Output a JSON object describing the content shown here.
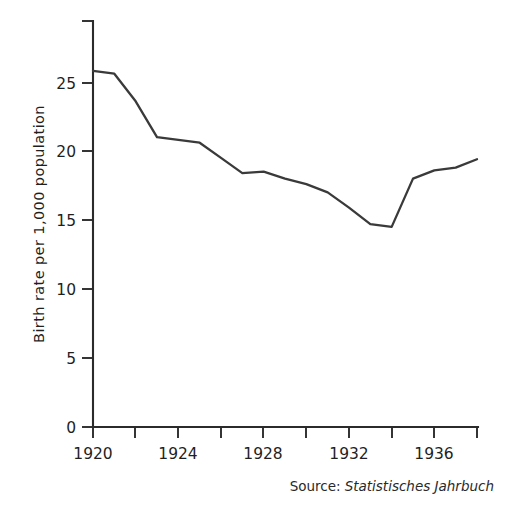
{
  "chart_data": {
    "type": "line",
    "title": "",
    "subtitle": "",
    "xlabel": "",
    "ylabel": "Birth rate per 1,000 population",
    "xlim": [
      1920,
      1938
    ],
    "ylim": [
      0,
      27
    ],
    "grid": false,
    "legend": null,
    "x": [
      1920,
      1921,
      1922,
      1923,
      1924,
      1925,
      1926,
      1927,
      1928,
      1929,
      1930,
      1931,
      1932,
      1933,
      1934,
      1935,
      1936,
      1937,
      1938
    ],
    "series": [
      {
        "name": "Birth rate",
        "values": [
          25.8,
          25.6,
          23.6,
          21.0,
          20.8,
          20.6,
          19.5,
          18.4,
          18.5,
          18.0,
          17.6,
          17.0,
          15.9,
          14.7,
          14.5,
          18.0,
          18.6,
          18.8,
          19.4
        ]
      }
    ],
    "yticks": [
      0,
      5,
      10,
      15,
      20,
      25
    ],
    "ytick_labels": [
      "0",
      "5",
      "10",
      "15",
      "20",
      "25"
    ],
    "xticks": [
      1920,
      1922,
      1924,
      1926,
      1928,
      1930,
      1932,
      1934,
      1936,
      1938
    ],
    "xtick_labels": [
      "1920",
      "",
      "1924",
      "",
      "1928",
      "",
      "1932",
      "",
      "1936",
      ""
    ],
    "xtick_labels_visible": [
      "1920",
      "1924",
      "1928",
      "1932",
      "1936"
    ],
    "line_color": "#3a3a3a",
    "axis_color": "#2b2b2b",
    "background_color": "#ffffff"
  },
  "axis": {
    "y_label": "Birth rate per 1,000 population",
    "y_tick_0": "0",
    "y_tick_5": "5",
    "y_tick_10": "10",
    "y_tick_15": "15",
    "y_tick_20": "20",
    "y_tick_25": "25",
    "x_tick_1920": "1920",
    "x_tick_1924": "1924",
    "x_tick_1928": "1928",
    "x_tick_1932": "1932",
    "x_tick_1936": "1936"
  },
  "source": {
    "label": "Source:",
    "value": "Statistisches Jahrbuch"
  }
}
